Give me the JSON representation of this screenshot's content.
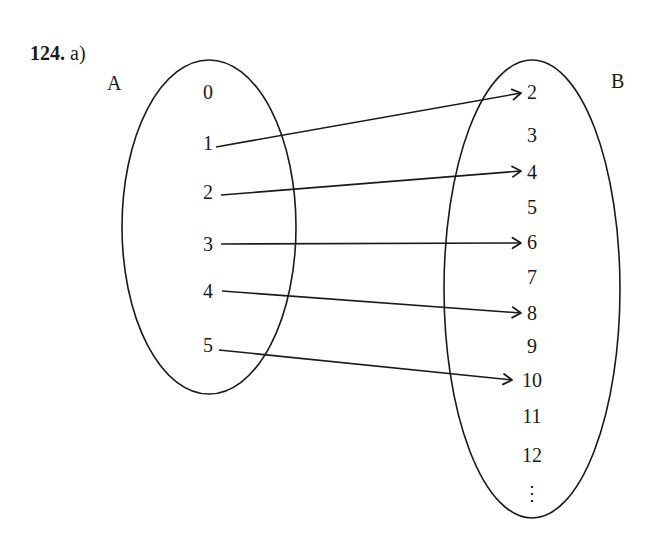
{
  "title": {
    "number": "124.",
    "part": "a)"
  },
  "sets": {
    "A": {
      "name": "A",
      "elements": [
        {
          "label": "0",
          "x": 208,
          "y": 99
        },
        {
          "label": "1",
          "x": 208,
          "y": 150
        },
        {
          "label": "2",
          "x": 208,
          "y": 199
        },
        {
          "label": "3",
          "x": 208,
          "y": 251
        },
        {
          "label": "4",
          "x": 208,
          "y": 298
        },
        {
          "label": "5",
          "x": 208,
          "y": 352
        }
      ]
    },
    "B": {
      "name": "B",
      "elements": [
        {
          "label": "2",
          "x": 532,
          "y": 99
        },
        {
          "label": "3",
          "x": 532,
          "y": 142
        },
        {
          "label": "4",
          "x": 532,
          "y": 179
        },
        {
          "label": "5",
          "x": 532,
          "y": 214
        },
        {
          "label": "6",
          "x": 532,
          "y": 249
        },
        {
          "label": "7",
          "x": 532,
          "y": 284
        },
        {
          "label": "8",
          "x": 532,
          "y": 320
        },
        {
          "label": "9",
          "x": 532,
          "y": 353
        },
        {
          "label": "10",
          "x": 532,
          "y": 387
        },
        {
          "label": "11",
          "x": 532,
          "y": 423
        },
        {
          "label": "12",
          "x": 532,
          "y": 462
        },
        {
          "label": "⋮",
          "x": 532,
          "y": 500
        }
      ]
    }
  },
  "mappings": [
    {
      "from": "1",
      "to": "2",
      "x1": 216,
      "y1": 147,
      "x2": 521,
      "y2": 93
    },
    {
      "from": "2",
      "to": "4",
      "x1": 221,
      "y1": 195,
      "x2": 521,
      "y2": 171
    },
    {
      "from": "3",
      "to": "6",
      "x1": 221,
      "y1": 244,
      "x2": 521,
      "y2": 243
    },
    {
      "from": "4",
      "to": "8",
      "x1": 222,
      "y1": 291,
      "x2": 521,
      "y2": 313
    },
    {
      "from": "5",
      "to": "10",
      "x1": 219,
      "y1": 350,
      "x2": 512,
      "y2": 380
    }
  ],
  "ellipses": {
    "A": {
      "cx": 209,
      "cy": 227,
      "rx": 87,
      "ry": 167
    },
    "B": {
      "cx": 532,
      "cy": 289,
      "rx": 88,
      "ry": 229
    }
  }
}
